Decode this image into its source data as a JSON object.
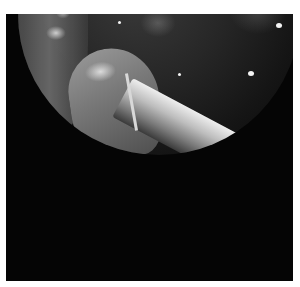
{
  "image": {
    "type": "endoscopic-view",
    "description": "Circular endoscopic field of view showing tissue with an instrument entering from lower right",
    "annotation_label": "1",
    "colors": {
      "background": "#ffffff",
      "frame": "#050505",
      "tissue_dark": "#262626",
      "highlight": "#f4f4f4"
    }
  }
}
